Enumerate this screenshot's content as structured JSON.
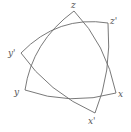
{
  "diagram": {
    "title": "",
    "stroke_color": "#6a6a6a",
    "triangle_1": {
      "vertices": [
        {
          "label": "z",
          "x": 74,
          "y": 11
        },
        {
          "label": "x",
          "x": 116,
          "y": 93
        },
        {
          "label": "y",
          "x": 25,
          "y": 90
        }
      ]
    },
    "triangle_2": {
      "vertices": [
        {
          "label": "z'",
          "x": 108,
          "y": 23
        },
        {
          "label": "x'",
          "x": 95,
          "y": 113
        },
        {
          "label": "y'",
          "x": 21,
          "y": 53
        }
      ]
    },
    "labels": {
      "z": "z",
      "z_prime": "z'",
      "y_prime": "y'",
      "y": "y",
      "x": "x",
      "x_prime": "x'"
    }
  }
}
